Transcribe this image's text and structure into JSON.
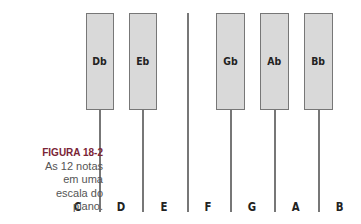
{
  "figure": {
    "label": "FIGURA 18-2",
    "caption_lines": [
      "As 12 notas",
      "em uma",
      "escala do",
      "piano."
    ]
  },
  "black_keys": [
    {
      "label": "Db"
    },
    {
      "label": "Eb"
    },
    {
      "label": "Gb"
    },
    {
      "label": "Ab"
    },
    {
      "label": "Bb"
    }
  ],
  "white_notes": [
    {
      "label": "C"
    },
    {
      "label": "D"
    },
    {
      "label": "E"
    },
    {
      "label": "F"
    },
    {
      "label": "G"
    },
    {
      "label": "A"
    },
    {
      "label": "B"
    }
  ],
  "colors": {
    "black_key_fill": "#d9d9d9",
    "key_border": "#777777",
    "figure_label": "#7a2436"
  }
}
